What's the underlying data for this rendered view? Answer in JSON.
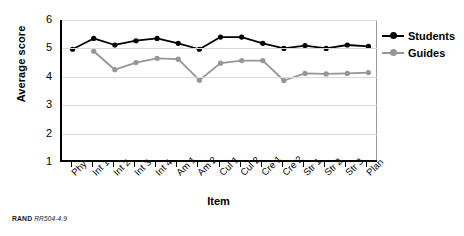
{
  "chart_data": {
    "type": "line",
    "title": "",
    "xlabel": "Item",
    "ylabel": "Average score",
    "ylim": [
      1,
      6
    ],
    "yticks": [
      1,
      2,
      3,
      4,
      5,
      6
    ],
    "grid": true,
    "legend_position": "right",
    "categories": [
      "Phy",
      "Int 1",
      "Int 2",
      "Int 3",
      "Int 4",
      "Am 1",
      "Am 2",
      "Cul 1",
      "Cul 2",
      "Cre 1",
      "Cre 2",
      "Str 1",
      "Str 2",
      "Str 3",
      "Plan"
    ],
    "series": [
      {
        "name": "Students",
        "color": "#000000",
        "values": [
          4.97,
          5.35,
          5.12,
          5.27,
          5.35,
          5.18,
          4.97,
          5.4,
          5.4,
          5.18,
          5.0,
          5.1,
          5.0,
          5.12,
          5.07
        ]
      },
      {
        "name": "Guides",
        "color": "#969696",
        "values": [
          null,
          4.9,
          4.25,
          4.5,
          4.65,
          4.62,
          3.88,
          4.48,
          4.57,
          4.57,
          3.87,
          4.12,
          4.1,
          4.12,
          4.15
        ]
      }
    ]
  },
  "legend": {
    "items": [
      {
        "label": "Students",
        "color": "#000000"
      },
      {
        "label": "Guides",
        "color": "#969696"
      }
    ]
  },
  "source_note": {
    "prefix": "RAND",
    "id": "RR504-4.9"
  }
}
